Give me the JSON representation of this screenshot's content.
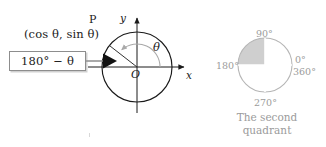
{
  "figure": {
    "background_color": "#ffffff",
    "ink_color": "#1a1a1a",
    "accent_gray": "#9b9b9b",
    "shade_color": "#cccccc"
  },
  "callout": {
    "box_label": "180° − θ",
    "border_color": "#8d8d8d",
    "connector_color": "#8d8d8d",
    "pointer_icon": "triangle-right-arrowhead"
  },
  "unit_circle": {
    "point_label": "P",
    "point_coordinates": "(cos θ, sin θ)",
    "angle_label": "θ",
    "origin_label": "O",
    "axis_x_label": "x",
    "axis_y_label": "y",
    "center_px": [
      137,
      67
    ],
    "radius_px": 35,
    "point_angle_deg": 142,
    "arc_color": "#a9a9a9",
    "circle_color": "#1a1a1a"
  },
  "quadrant_key": {
    "labels": {
      "top": "90°",
      "left": "180°",
      "right_zero": "0°",
      "right_full": "360°",
      "bottom": "270°"
    },
    "caption_line1": "The second",
    "caption_line2": "quadrant",
    "highlighted_quadrant": 2,
    "center_px": [
      265,
      65
    ],
    "radius_px": 27,
    "outline_color": "#b5b5b5",
    "fill_color": "#cfcfcf"
  }
}
